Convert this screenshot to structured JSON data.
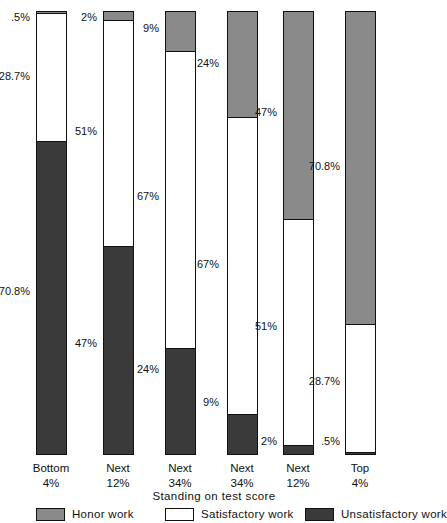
{
  "chart_data": {
    "type": "bar",
    "subtype": "stacked-bar-100pct",
    "title": "",
    "xlabel": "Standing on test score",
    "ylabel": "",
    "ylim": [
      0,
      100
    ],
    "grid": false,
    "legend_position": "bottom",
    "categories": [
      "Bottom 4%",
      "Next 12%",
      "Next 34%",
      "Next 34%",
      "Next 12%",
      "Top 4%"
    ],
    "category_lines": [
      [
        "Bottom",
        "4%"
      ],
      [
        "Next",
        "12%"
      ],
      [
        "Next",
        "34%"
      ],
      [
        "Next",
        "34%"
      ],
      [
        "Next",
        "12%"
      ],
      [
        "Top",
        "4%"
      ]
    ],
    "series": [
      {
        "name": "Honor work",
        "color": "#8a8a8a",
        "values": [
          0.5,
          2,
          9,
          24,
          47,
          70.8
        ],
        "labels": [
          ".5%",
          "2%",
          "9%",
          "24%",
          "47%",
          "70.8%"
        ]
      },
      {
        "name": "Satisfactory work",
        "color": "#ffffff",
        "values": [
          28.7,
          51,
          67,
          67,
          51,
          28.7
        ],
        "labels": [
          "28.7%",
          "51%",
          "67%",
          "67%",
          "51%",
          "28.7%"
        ]
      },
      {
        "name": "Unsatisfactory work",
        "color": "#3a3a3a",
        "values": [
          70.8,
          47,
          24,
          9,
          2,
          0.5
        ],
        "labels": [
          "70.8%",
          "47%",
          "24%",
          "9%",
          "2%",
          ".5%"
        ]
      }
    ]
  },
  "axis": {
    "x_title": "Standing on test score"
  },
  "legend": {
    "items": [
      {
        "label": "Honor work",
        "swatch": "honor"
      },
      {
        "label": "Satisfactory work",
        "swatch": "satisfactory"
      },
      {
        "label": "Unsatisfactory work",
        "swatch": "unsatisfactory"
      }
    ]
  },
  "labels": {
    "b1_honor": ".5%",
    "b1_satisfactory": "28.7%",
    "b1_unsatisfactory": "70.8%",
    "b2_honor": "2%",
    "b2_satisfactory": "51%",
    "b2_unsatisfactory": "47%",
    "b3_honor": "9%",
    "b3_satisfactory": "67%",
    "b3_unsatisfactory": "24%",
    "b4_honor": "24%",
    "b4_satisfactory": "67%",
    "b4_unsatisfactory": "9%",
    "b5_honor": "47%",
    "b5_satisfactory": "51%",
    "b5_unsatisfactory": "2%",
    "b6_honor": "70.8%",
    "b6_satisfactory": "28.7%",
    "b6_unsatisfactory": ".5%"
  },
  "categories": {
    "c1_top": "Bottom",
    "c1_bottom": "4%",
    "c2_top": "Next",
    "c2_bottom": "12%",
    "c3_top": "Next",
    "c3_bottom": "34%",
    "c4_top": "Next",
    "c4_bottom": "34%",
    "c5_top": "Next",
    "c5_bottom": "12%",
    "c6_top": "Top",
    "c6_bottom": "4%"
  },
  "legend_labels": {
    "honor": "Honor work",
    "satisfactory": "Satisfactory work",
    "unsatisfactory": "Unsatisfactory work"
  },
  "colors": {
    "honor": "#8a8a8a",
    "satisfactory": "#ffffff",
    "unsatisfactory": "#3a3a3a",
    "outline": "#111111",
    "background": "#ffffff"
  }
}
